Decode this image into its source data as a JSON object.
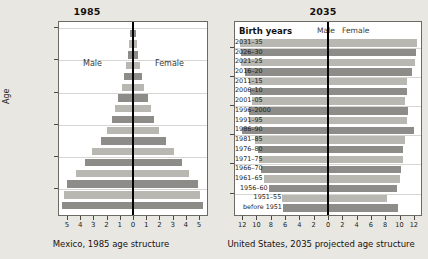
{
  "left": {
    "title": "1985",
    "caption": "Mexico, 1985 age structure",
    "y_axis_title": "Age",
    "male_label": "Male",
    "female_label": "Female"
  },
  "right": {
    "title": "2035",
    "caption": "United States, 2035 projected age structure",
    "birth_years_title": "Birth years",
    "male_label": "Male",
    "female_label": "Female"
  },
  "colors": {
    "bar_dark": "#8e8c88",
    "bar_light": "#b9b7b2",
    "axis": "#000000",
    "plot_bg": "#ffffff",
    "page_bg": "#e9e7e2",
    "grid": "#d8d6d2"
  },
  "chart_data": [
    {
      "type": "bar",
      "orientation": "horizontal",
      "subtype": "population-pyramid",
      "title": "1985",
      "subtitle": "Mexico, 1985 age structure",
      "xlabel": "",
      "ylabel": "Age",
      "xlim": [
        -5.6,
        5.6
      ],
      "xticks": [
        -5,
        -4,
        -3,
        -2,
        -1,
        0,
        1,
        2,
        3,
        4,
        5
      ],
      "xticklabels": [
        "5",
        "4",
        "3",
        "2",
        "1",
        "0",
        "1",
        "2",
        "3",
        "4",
        "5"
      ],
      "grid": true,
      "legend": [
        "Male",
        "Female"
      ],
      "legend_position": "inside-upper",
      "categories": [
        "0-4",
        "5-9",
        "10-14",
        "15-19",
        "20-24",
        "25-29",
        "30-34",
        "35-39",
        "40-44",
        "45-49",
        "50-54",
        "55-59",
        "60-64",
        "65-69",
        "70-74",
        "75-79",
        "80+"
      ],
      "series": [
        {
          "name": "Male",
          "values": [
            5.4,
            5.2,
            5.0,
            4.3,
            3.6,
            3.1,
            2.4,
            2.0,
            1.6,
            1.35,
            1.1,
            0.85,
            0.7,
            0.5,
            0.38,
            0.27,
            0.2
          ]
        },
        {
          "name": "Female",
          "values": [
            5.3,
            5.1,
            4.9,
            4.2,
            3.7,
            3.1,
            2.5,
            2.0,
            1.6,
            1.35,
            1.1,
            0.85,
            0.7,
            0.5,
            0.38,
            0.28,
            0.25
          ]
        }
      ]
    },
    {
      "type": "bar",
      "orientation": "horizontal",
      "subtype": "population-pyramid",
      "title": "2035",
      "subtitle": "United States, 2035 projected age structure",
      "xlabel": "",
      "ylabel": "Birth years",
      "xlim": [
        -13,
        13
      ],
      "xticks": [
        -12,
        -10,
        -8,
        -6,
        -4,
        -2,
        0,
        2,
        4,
        6,
        8,
        10,
        12
      ],
      "xticklabels": [
        "12",
        "10",
        "8",
        "6",
        "4",
        "2",
        "0",
        "2",
        "4",
        "6",
        "8",
        "10",
        "12"
      ],
      "grid": true,
      "legend": [
        "Male",
        "Female"
      ],
      "legend_position": "inside-top",
      "categories": [
        "before 1951",
        "1951–55",
        "1956–60",
        "1961–65",
        "1966–70",
        "1971–75",
        "1976–80",
        "1981–85",
        "1986–90",
        "1991–95",
        "1996–2000",
        "2001–05",
        "2006–10",
        "2011–15",
        "2016–20",
        "2021–25",
        "2026–30",
        "2031–35"
      ],
      "series": [
        {
          "name": "Male",
          "values": [
            6.3,
            6.4,
            8.3,
            9.0,
            9.4,
            9.6,
            9.8,
            10.2,
            12.0,
            11.0,
            11.1,
            10.6,
            10.9,
            11.0,
            11.6,
            12.1,
            12.2,
            12.3
          ]
        },
        {
          "name": "Female",
          "values": [
            9.8,
            8.3,
            9.6,
            10.0,
            10.2,
            10.5,
            10.5,
            10.8,
            12.0,
            11.1,
            11.2,
            10.8,
            11.0,
            11.1,
            11.7,
            12.2,
            12.3,
            12.4
          ]
        }
      ]
    }
  ]
}
